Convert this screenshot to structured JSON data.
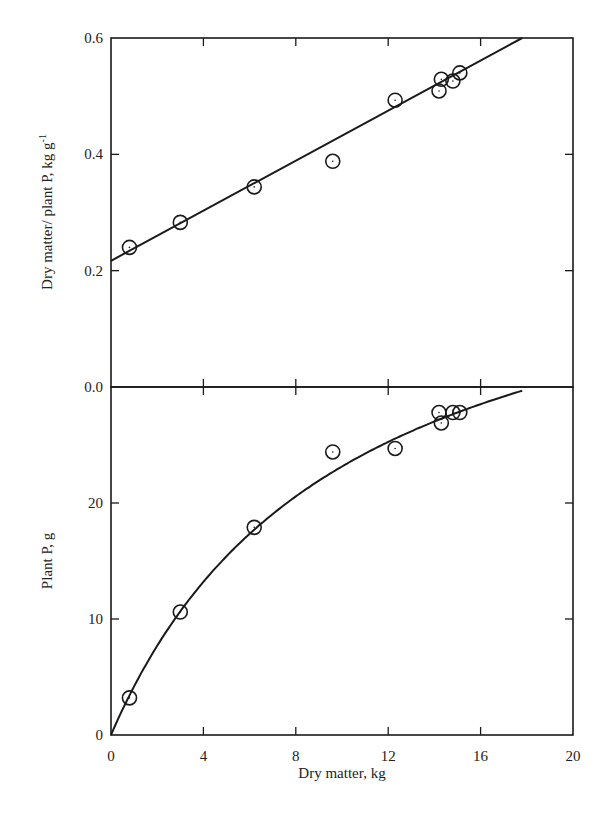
{
  "chart_data": [
    {
      "type": "scatter",
      "panel": "top",
      "title": "",
      "xlabel": "Dry matter, kg",
      "ylabel": "Dry matter/ plant P, kg g",
      "ylabel_superscript": "-1",
      "xlim": [
        0,
        20
      ],
      "ylim": [
        0.0,
        0.6
      ],
      "x_ticks": [
        0,
        4,
        8,
        12,
        16,
        20
      ],
      "y_ticks": [
        0.0,
        0.2,
        0.4,
        0.6
      ],
      "y_tick_labels": [
        "0.0",
        "0.2",
        "0.4",
        "0.6"
      ],
      "grid": false,
      "legend": null,
      "series": [
        {
          "name": "observed",
          "marker": "circle-dot",
          "x": [
            0.8,
            3.0,
            6.2,
            9.6,
            12.3,
            14.2,
            14.3,
            14.8,
            15.1
          ],
          "y": [
            0.24,
            0.283,
            0.344,
            0.388,
            0.493,
            0.509,
            0.529,
            0.526,
            0.54
          ]
        },
        {
          "name": "fitted line",
          "style": "line",
          "intercept": 0.217,
          "slope": 0.0215,
          "x": [
            0,
            17.8
          ],
          "y": [
            0.217,
            0.6
          ]
        }
      ]
    },
    {
      "type": "scatter",
      "panel": "bottom",
      "title": "",
      "xlabel": "Dry matter, kg",
      "ylabel": "Plant P, g",
      "xlim": [
        0,
        20
      ],
      "ylim": [
        0,
        30
      ],
      "x_ticks": [
        0,
        4,
        8,
        12,
        16,
        20
      ],
      "x_tick_labels": [
        "0",
        "4",
        "8",
        "12",
        "16",
        "20"
      ],
      "y_ticks": [
        0,
        10,
        20
      ],
      "y_tick_labels": [
        "0",
        "10",
        "20"
      ],
      "grid": false,
      "legend": null,
      "series": [
        {
          "name": "observed",
          "marker": "circle-dot",
          "x": [
            0.8,
            3.0,
            6.2,
            9.6,
            12.3,
            14.2,
            14.3,
            14.8,
            15.1
          ],
          "y": [
            3.2,
            10.6,
            17.9,
            24.4,
            24.7,
            27.8,
            26.9,
            27.8,
            27.8
          ]
        },
        {
          "name": "fitted curve",
          "style": "curve",
          "equation": "y = x / (0.217 + 0.0215 x)",
          "x": [
            0,
            2,
            4,
            6,
            8,
            10,
            12,
            14,
            16,
            17.8
          ],
          "y": [
            0,
            7.8,
            13.2,
            17.3,
            20.6,
            23.1,
            25.2,
            27.0,
            28.5,
            29.9
          ]
        }
      ]
    }
  ],
  "labels": {
    "top_ylabel": "Dry matter/ plant P, kg g",
    "top_ylabel_sup": "-1",
    "bottom_ylabel": "Plant P, g",
    "xlabel": "Dry matter, kg"
  }
}
